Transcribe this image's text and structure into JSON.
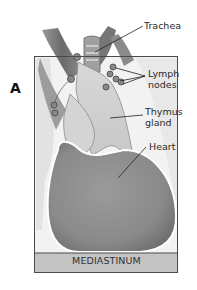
{
  "figure": {
    "panel_letter": "A",
    "region_label": "MEDIASTINUM",
    "labels": {
      "trachea": "Trachea",
      "lymph_nodes_line1": "Lymph",
      "lymph_nodes_line2": "nodes",
      "thymus_line1": "Thymus",
      "thymus_line2": "gland",
      "heart": "Heart"
    },
    "colors": {
      "frame": "#4a4a4a",
      "band": "#c4c4c4",
      "heart": "#8e8e8e",
      "thymus": "#d6d6d6",
      "vessels": "#7a7a7a",
      "background_panel": "#ececec"
    }
  }
}
